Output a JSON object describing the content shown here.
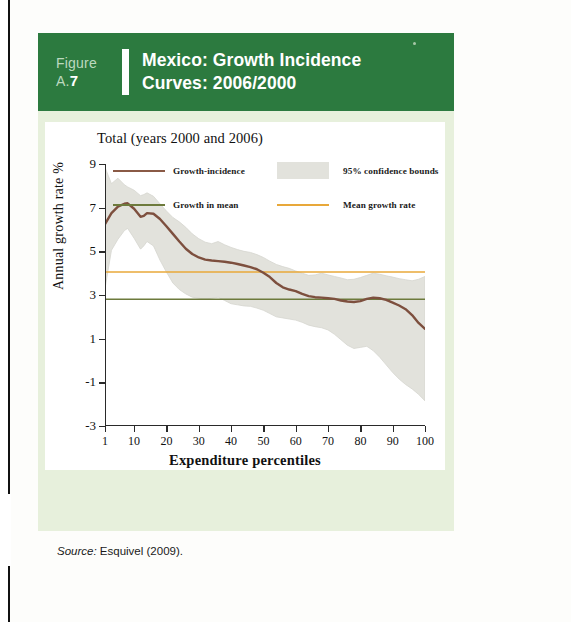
{
  "figure": {
    "number_label": "Figure",
    "number_value_prefix": "A.",
    "number_value": "7",
    "title_line1": "Mexico: Growth Incidence",
    "title_line2": "Curves: 2006/2000",
    "header_color": "#2c7a3f",
    "panel_color": "#e7f0dc"
  },
  "source": {
    "label": "Source:",
    "text": "Esquivel (2009)."
  },
  "legend": {
    "items": [
      {
        "label": "Growth-incidence",
        "type": "line",
        "color": "#8a5a46"
      },
      {
        "label": "Growth in mean",
        "type": "line",
        "color": "#6d7a3c"
      },
      {
        "label": "95% confidence bounds",
        "type": "swatch",
        "color": "#e2e2dc"
      },
      {
        "label": "Mean growth rate",
        "type": "line",
        "color": "#e8a83a"
      }
    ]
  },
  "chart_data": {
    "type": "line",
    "title": "Total (years 2000 and 2006)",
    "xlabel": "Expenditure percentiles",
    "ylabel": "Annual growth rate %",
    "xlim": [
      1,
      100
    ],
    "ylim": [
      -3,
      9
    ],
    "xticks": [
      1,
      10,
      20,
      30,
      40,
      50,
      60,
      70,
      80,
      90,
      100
    ],
    "xtick_labels": [
      "1",
      "10",
      "20",
      "30",
      "40",
      "50",
      "60",
      "70",
      "80",
      "90",
      "100"
    ],
    "yticks": [
      9,
      7,
      5,
      3,
      1,
      -1,
      -3
    ],
    "ytick_labels": [
      "9",
      "7",
      "5",
      "3",
      "1",
      "-1",
      "-3"
    ],
    "grid": false,
    "legend_position": "top-inside",
    "reference_lines": [
      {
        "name": "Mean growth rate",
        "value": 4.05,
        "color": "#e8a83a"
      },
      {
        "name": "Growth in mean",
        "value": 2.8,
        "color": "#6d7a3c"
      }
    ],
    "series": [
      {
        "name": "Growth-incidence",
        "color": "#7d4f3e",
        "x": [
          1,
          3,
          5,
          7,
          8,
          10,
          12,
          13,
          14,
          16,
          18,
          20,
          22,
          24,
          26,
          28,
          30,
          32,
          34,
          36,
          38,
          40,
          42,
          44,
          46,
          48,
          50,
          52,
          54,
          56,
          58,
          60,
          62,
          64,
          66,
          68,
          70,
          72,
          74,
          76,
          78,
          80,
          82,
          84,
          86,
          88,
          90,
          92,
          94,
          96,
          98,
          100
        ],
        "y": [
          6.25,
          6.75,
          7.05,
          7.18,
          7.2,
          6.95,
          6.58,
          6.62,
          6.75,
          6.72,
          6.48,
          6.15,
          5.8,
          5.45,
          5.12,
          4.88,
          4.72,
          4.62,
          4.58,
          4.55,
          4.52,
          4.48,
          4.42,
          4.35,
          4.28,
          4.18,
          4.02,
          3.82,
          3.55,
          3.35,
          3.25,
          3.18,
          3.05,
          2.95,
          2.9,
          2.88,
          2.85,
          2.82,
          2.75,
          2.7,
          2.68,
          2.72,
          2.82,
          2.88,
          2.85,
          2.78,
          2.65,
          2.52,
          2.35,
          2.08,
          1.72,
          1.45
        ]
      },
      {
        "name": "95% confidence upper bound",
        "color": "#e2e2dc",
        "x": [
          1,
          3,
          5,
          7,
          8,
          10,
          12,
          13,
          14,
          16,
          18,
          20,
          22,
          24,
          26,
          28,
          30,
          32,
          34,
          36,
          38,
          40,
          42,
          44,
          46,
          48,
          50,
          52,
          54,
          56,
          58,
          60,
          62,
          64,
          66,
          68,
          70,
          72,
          74,
          76,
          78,
          80,
          82,
          84,
          86,
          88,
          90,
          92,
          94,
          96,
          98,
          100
        ],
        "y": [
          8.85,
          8.1,
          8.35,
          8.05,
          7.95,
          7.8,
          7.55,
          7.6,
          7.68,
          7.52,
          7.18,
          6.85,
          6.55,
          6.35,
          6.1,
          5.8,
          5.58,
          5.42,
          5.35,
          5.45,
          5.3,
          5.18,
          5.08,
          5.0,
          4.95,
          4.85,
          4.72,
          4.55,
          4.4,
          4.3,
          4.22,
          4.1,
          4.0,
          3.9,
          3.92,
          4.0,
          3.92,
          3.85,
          3.78,
          3.7,
          3.72,
          3.8,
          3.9,
          4.0,
          3.95,
          3.88,
          3.82,
          3.75,
          3.7,
          3.65,
          3.72,
          3.85
        ]
      },
      {
        "name": "95% confidence lower bound",
        "color": "#e2e2dc",
        "x": [
          1,
          3,
          5,
          7,
          8,
          10,
          12,
          13,
          14,
          16,
          18,
          20,
          22,
          24,
          26,
          28,
          30,
          32,
          34,
          36,
          38,
          40,
          42,
          44,
          46,
          48,
          50,
          52,
          54,
          56,
          58,
          60,
          62,
          64,
          66,
          68,
          70,
          72,
          74,
          76,
          78,
          80,
          82,
          84,
          86,
          88,
          90,
          92,
          94,
          96,
          98,
          100
        ],
        "y": [
          3.3,
          5.05,
          5.55,
          5.95,
          6.05,
          5.6,
          5.1,
          5.25,
          5.45,
          5.25,
          4.6,
          4.05,
          3.55,
          3.25,
          3.05,
          2.9,
          2.85,
          2.82,
          2.85,
          2.9,
          2.75,
          2.6,
          2.55,
          2.5,
          2.48,
          2.4,
          2.3,
          2.15,
          2.0,
          1.95,
          1.9,
          1.85,
          1.75,
          1.62,
          1.55,
          1.5,
          1.4,
          1.2,
          0.95,
          0.7,
          0.55,
          0.6,
          0.65,
          0.45,
          0.15,
          -0.2,
          -0.55,
          -0.85,
          -1.1,
          -1.3,
          -1.55,
          -1.85
        ]
      }
    ]
  }
}
